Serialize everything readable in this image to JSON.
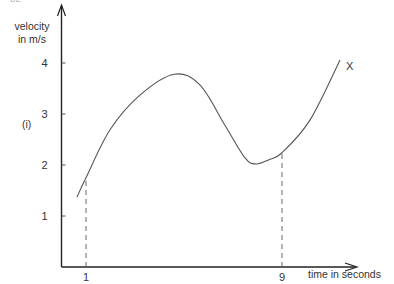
{
  "page": {
    "page_number_partial": "32"
  },
  "chart_data": {
    "type": "line",
    "title": "",
    "part_label": "(i)",
    "xlabel": "time in seconds",
    "ylabel_line1": "velocity",
    "ylabel_line2": "in  m/s",
    "xlim": [
      0,
      13
    ],
    "ylim": [
      0,
      4.9
    ],
    "grid": false,
    "legend": "none",
    "x_ticks": [
      {
        "value": 1,
        "label": "1"
      },
      {
        "value": 9,
        "label": "9"
      }
    ],
    "y_ticks": [
      {
        "value": 1,
        "label": "1"
      },
      {
        "value": 2,
        "label": "2"
      },
      {
        "value": 3,
        "label": "3"
      },
      {
        "value": 4,
        "label": "4"
      }
    ],
    "series": [
      {
        "name": "X",
        "label": "X",
        "color": "#555555",
        "x": [
          0.63,
          1.0,
          1.98,
          3.2,
          4.6,
          5.65,
          6.67,
          7.49,
          7.94,
          8.45,
          9.0,
          10.14,
          11.37
        ],
        "y": [
          1.37,
          1.75,
          2.69,
          3.37,
          3.78,
          3.57,
          2.78,
          2.14,
          2.02,
          2.1,
          2.24,
          2.88,
          4.06
        ]
      }
    ],
    "annotations": [
      {
        "type": "dashed-vertical",
        "x": 1,
        "y_top": 1.75
      },
      {
        "type": "dashed-vertical",
        "x": 9,
        "y_top": 2.24
      }
    ]
  }
}
